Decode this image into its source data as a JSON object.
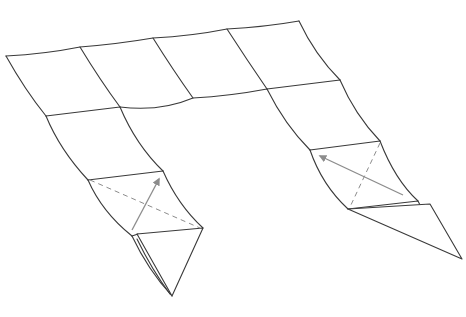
{
  "diagram": {
    "style": {
      "line_color": "#3a3a3a",
      "guide_color": "#8c8c8c",
      "background": "#ffffff"
    },
    "elements": {
      "top_grid": "4x1 grid of squares along top edge",
      "left_leg": "left leg, 2 squares down, folding tip",
      "right_leg": "right leg, 2 squares down, folding tip",
      "left_valley_fold": "dashed valley fold line on left leg",
      "right_valley_fold": "dashed valley fold line on right leg",
      "left_fold_arrow": "arrow indicating fold direction on left leg",
      "right_fold_arrow": "arrow indicating fold direction on right leg"
    }
  }
}
